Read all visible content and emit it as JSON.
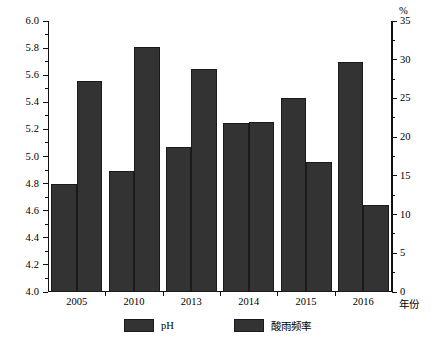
{
  "chart_data": {
    "type": "bar",
    "title": "",
    "subtitle": "",
    "categories": [
      "2005",
      "2010",
      "2013",
      "2014",
      "2015",
      "2016"
    ],
    "series": [
      {
        "name": "pH",
        "axis": "left",
        "values": [
          4.8,
          4.89,
          5.07,
          5.25,
          5.43,
          5.7
        ],
        "color": "#333333"
      },
      {
        "name": "酸雨频率",
        "axis": "right",
        "values": [
          27.2,
          31.6,
          28.8,
          22.0,
          16.8,
          11.3
        ],
        "color": "#333333"
      }
    ],
    "xlabel": "年份",
    "ylabel_left": "",
    "ylabel_right": "%",
    "ylim_left": [
      4.0,
      6.0
    ],
    "ylim_right": [
      0,
      35
    ],
    "ytick_step_left": 0.2,
    "ytick_step_right": 5,
    "grid": false,
    "legend_position": "bottom"
  },
  "axes": {
    "left_ticks": [
      "6.0",
      "5.8",
      "5.6",
      "5.4",
      "5.2",
      "5.0",
      "4.8",
      "4.6",
      "4.4",
      "4.2",
      "4.0"
    ],
    "right_ticks": [
      "35",
      "30",
      "25",
      "20",
      "15",
      "10",
      "5",
      "0"
    ],
    "right_unit": "%",
    "x_axis_title": "年份"
  },
  "legend": {
    "items": [
      {
        "label": "pH",
        "color": "#333333"
      },
      {
        "label": "酸雨频率",
        "color": "#333333"
      }
    ]
  }
}
